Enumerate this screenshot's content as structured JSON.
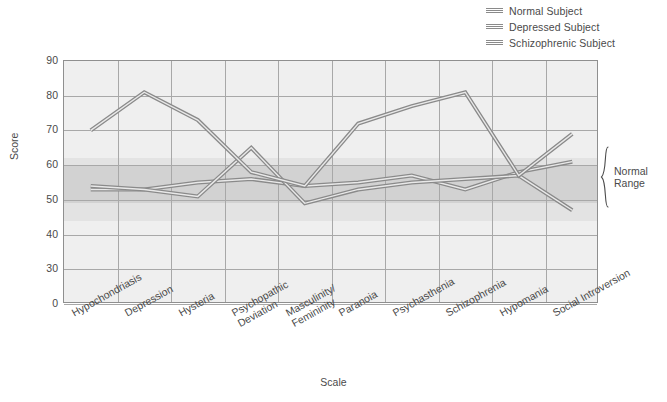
{
  "chart_data": {
    "type": "line",
    "title": "",
    "xlabel": "Scale",
    "ylabel": "Score",
    "ylim": [
      0,
      90
    ],
    "yticks": [
      90,
      80,
      70,
      60,
      50,
      40,
      30,
      0
    ],
    "grid": true,
    "legend_position": "top-right",
    "categories": [
      "Hypochondriasis",
      "Depression",
      "Hysteria",
      "Psychopathic Deviation",
      "Masculinity/Femininity",
      "Paranoia",
      "Psychasthenia",
      "Schizophrenia",
      "Hypomania",
      "Social Introversion"
    ],
    "category_lines": [
      [
        "Hypochondriasis"
      ],
      [
        "Depression"
      ],
      [
        "Hysteria"
      ],
      [
        "Psychopathic",
        "Deviation"
      ],
      [
        "Masculinity/",
        "Femininity"
      ],
      [
        "Paranoia"
      ],
      [
        "Psychasthenia"
      ],
      [
        "Schizophrenia"
      ],
      [
        "Hypomania"
      ],
      [
        "Social Introversion"
      ]
    ],
    "series": [
      {
        "name": "Normal Subject",
        "color": "#8a8a8a",
        "values": [
          53,
          53,
          55,
          56,
          54,
          55,
          57,
          53,
          58,
          61
        ]
      },
      {
        "name": "Depressed Subject",
        "color": "#8a8a8a",
        "values": [
          54,
          53,
          51,
          65,
          49,
          53,
          55,
          56,
          57,
          47
        ]
      },
      {
        "name": "Schizophrenic Subject",
        "color": "#8a8a8a",
        "values": [
          70,
          81,
          73,
          58,
          54,
          72,
          77,
          81,
          57,
          69
        ]
      }
    ],
    "annotations": [
      {
        "name": "normal-range",
        "text_lines": [
          "Normal",
          "Range"
        ],
        "y_from": 45,
        "y_to": 60
      }
    ],
    "shaded_band": {
      "label": "Normal Range",
      "y_from": 45,
      "y_to": 60,
      "color": "#d8d8d8"
    }
  },
  "legend": {
    "items": [
      {
        "label": "Normal Subject",
        "color": "#8a8a8a"
      },
      {
        "label": "Depressed Subject",
        "color": "#8a8a8a"
      },
      {
        "label": "Schizophrenic Subject",
        "color": "#8a8a8a"
      }
    ]
  },
  "axes": {
    "y_title": "Score",
    "x_title": "Scale"
  },
  "brace": {
    "line1": "Normal",
    "line2": "Range"
  }
}
